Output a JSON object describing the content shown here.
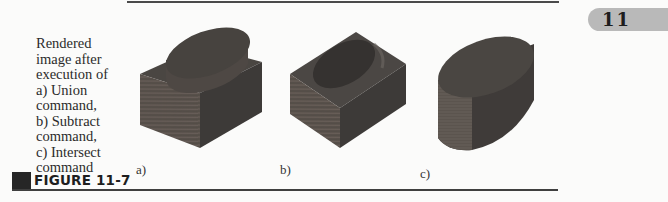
{
  "page": {
    "chapter_tab": "11",
    "figure_label": "FIGURE 11-7",
    "caption_lines": [
      "Rendered",
      "image after",
      "execution of",
      "a) Union",
      "command,",
      "b) Subtract",
      "command,",
      "c) Intersect",
      "command"
    ],
    "panels": [
      {
        "label": "a)",
        "depicts": "Union of box and cylinder (wood texture)"
      },
      {
        "label": "b)",
        "depicts": "Subtract cylinder from box (wood texture)"
      },
      {
        "label": "c)",
        "depicts": "Intersect of box and cylinder (wood texture)"
      }
    ],
    "colors": {
      "wood_top": "#4a4642",
      "wood_front": "#5a524c",
      "wood_side": "#3a3836",
      "rule": "#3f3f3f",
      "tab": "#b9b9b9"
    }
  }
}
